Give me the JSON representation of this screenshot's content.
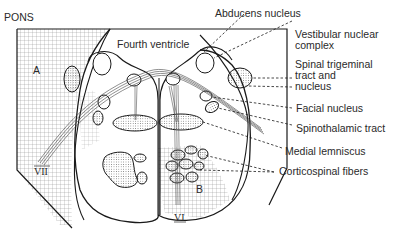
{
  "title": "PONS",
  "regions": {
    "a": "A",
    "b": "B"
  },
  "labels": {
    "fourth_ventricle": "Fourth ventricle",
    "abducens_nucleus": "Abducens nucleus",
    "vestibular_1": "Vestibular nuclear",
    "vestibular_2": "complex",
    "trigeminal_1": "Spinal trigeminal",
    "trigeminal_2": "tract and",
    "trigeminal_3": "nucleus",
    "facial_nucleus": "Facial nucleus",
    "spinothalamic": "Spinothalamic tract",
    "medial_lemniscus": "Medial lemniscus",
    "corticospinal": "Corticospinal fibers"
  },
  "nerves": {
    "vii": "VII",
    "vi": "VI"
  },
  "colors": {
    "line": "#1a1a1a",
    "grid": "#8a8a8a",
    "text": "#2a2a2a"
  }
}
